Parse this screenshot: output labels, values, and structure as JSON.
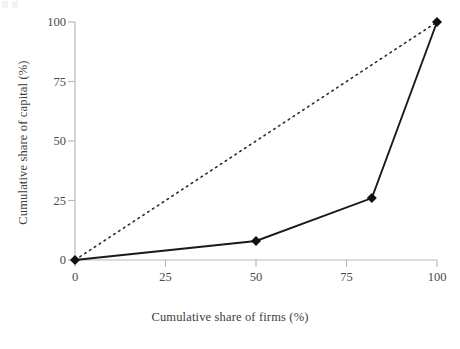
{
  "chart_data": {
    "type": "line",
    "title": "",
    "xlabel": "Cumulative share of firms (%)",
    "ylabel": "Cumulative share of capital (%)",
    "xlim": [
      0,
      100
    ],
    "ylim": [
      0,
      100
    ],
    "xticks": [
      0,
      25,
      50,
      75,
      100
    ],
    "yticks": [
      0,
      25,
      50,
      75,
      100
    ],
    "xtick_labels": [
      "0",
      "25",
      "50",
      "75",
      "100"
    ],
    "ytick_labels": [
      "0",
      "25",
      "50",
      "75",
      "100"
    ],
    "grid": false,
    "legend": "none",
    "series": [
      {
        "name": "Lorenz curve",
        "style": "solid",
        "color": "#1a1a1a",
        "marker": "diamond",
        "x": [
          0,
          50,
          82,
          100
        ],
        "y": [
          0,
          8,
          26,
          100
        ]
      },
      {
        "name": "Line of equality",
        "style": "dotted",
        "color": "#2b2b2b",
        "marker": "none",
        "x": [
          0,
          100
        ],
        "y": [
          0,
          100
        ]
      }
    ]
  },
  "axes": {
    "axis_color": "#b9b9b9",
    "tick_color": "#b9b9b9",
    "background": "#ffffff"
  }
}
